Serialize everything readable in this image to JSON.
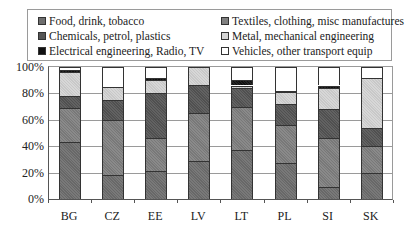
{
  "chart_data": {
    "type": "bar",
    "stacked": true,
    "title": "",
    "xlabel": "",
    "ylabel": "",
    "ylim": [
      0,
      100
    ],
    "yticks": [
      "0%",
      "20%",
      "40%",
      "60%",
      "80%",
      "100%"
    ],
    "grid": true,
    "legend_position": "top",
    "categories": [
      "BG",
      "CZ",
      "EE",
      "LV",
      "LT",
      "PL",
      "SI",
      "SK"
    ],
    "series": [
      {
        "name": "Food, drink, tobacco",
        "color": "#6e6e6e",
        "values": [
          43,
          18,
          21,
          29,
          37,
          27,
          9,
          20
        ]
      },
      {
        "name": "Textiles, clothing, misc manufactures",
        "color": "#808080",
        "values": [
          26,
          42,
          25,
          36,
          33,
          29,
          37,
          20
        ]
      },
      {
        "name": "Chemicals, petrol, plastics",
        "color": "#555555",
        "values": [
          9,
          15,
          34,
          21,
          14,
          16,
          22,
          14
        ]
      },
      {
        "name": "Metal, mechanical engineering",
        "color": "#d4d4d4",
        "values": [
          18,
          10,
          10,
          14,
          2,
          9,
          16,
          38
        ]
      },
      {
        "name": "Electrical engineering, Radio, TV",
        "color": "#111111",
        "values": [
          2,
          0,
          2,
          0,
          4,
          1,
          2,
          0
        ]
      },
      {
        "name": "Vehicles, other transport equip",
        "color": "#ffffff",
        "values": [
          0,
          0,
          0,
          0,
          0,
          0,
          0,
          0
        ]
      }
    ],
    "totals": [
      98,
      85,
      92,
      100,
      90,
      82,
      86,
      92
    ]
  },
  "legend": {
    "items": [
      {
        "label": "Food, drink, tobacco",
        "color": "#6e6e6e"
      },
      {
        "label": "Textiles, clothing, misc manufactures",
        "color": "#808080"
      },
      {
        "label": "Chemicals, petrol, plastics",
        "color": "#555555"
      },
      {
        "label": "Metal, mechanical engineering",
        "color": "#d4d4d4"
      },
      {
        "label": "Electrical engineering, Radio, TV",
        "color": "#111111"
      },
      {
        "label": "Vehicles, other transport equip",
        "color": "#ffffff"
      }
    ]
  },
  "axis": {
    "y_labels": [
      "0%",
      "20%",
      "40%",
      "60%",
      "80%",
      "100%"
    ],
    "x_labels": [
      "BG",
      "CZ",
      "EE",
      "LV",
      "LT",
      "PL",
      "SI",
      "SK"
    ]
  }
}
